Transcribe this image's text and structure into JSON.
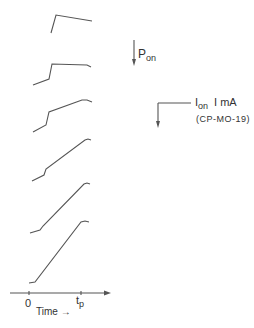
{
  "diagram": {
    "axis": {
      "origin_label": "0",
      "tp_label_main": "t",
      "tp_label_sub": "p",
      "time_label": "Time →"
    },
    "annotations": {
      "pon_main": "P",
      "pon_sub": "on",
      "ion_main": "I",
      "ion_sub": "on",
      "ion_value": "I mA",
      "ion_ref": "(CP-MO-19)"
    },
    "traces": [
      {
        "id": 1,
        "points": "51,33 56,15 92,21"
      },
      {
        "id": 2,
        "points": "33,85 49,79 52,64 87,65 91,67"
      },
      {
        "id": 3,
        "points": "33,132 46,125 49,112 82,100 87,100 92,102"
      },
      {
        "id": 4,
        "points": "32,181 44,175 46,169 85,140 88,139 91,140"
      },
      {
        "id": 5,
        "points": "30,233 40,230 43,226 84,184 87,183 90,184"
      },
      {
        "id": 6,
        "points": "29,283 35,282 81,222 85,221 89,222"
      }
    ],
    "line_color": "#555555"
  }
}
